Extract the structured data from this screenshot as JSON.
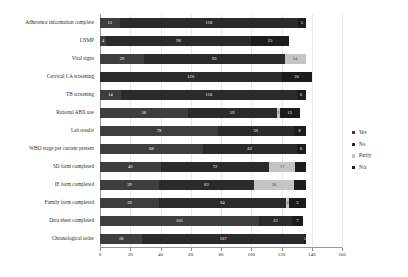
{
  "chart_data": {
    "type": "bar",
    "subtype": "stacked-horizontal",
    "title": "",
    "xlabel": "",
    "ylabel": "",
    "xlim": [
      0,
      160
    ],
    "ylim": null,
    "grid": true,
    "legend_position": "right",
    "xticks": [
      0,
      20,
      40,
      60,
      80,
      100,
      120,
      140,
      160
    ],
    "xtick_labels": [
      "0",
      "20",
      "40",
      "60",
      "80",
      "100",
      "120",
      "140",
      "160"
    ],
    "categories": [
      "Adherence information complete",
      "LNMP",
      "Vital signs",
      "Cervical CA screening",
      "TB screening",
      "Rational ABX use",
      "Lab results",
      "WHO stage per current present",
      "SD form completed",
      "IE form completed",
      "Family form completed",
      "Data sheet completed",
      "Chronological order"
    ],
    "series": [
      {
        "name": "Yes",
        "color": "#3e3e3e",
        "values": [
          13,
          4,
          29,
          0,
          14,
          58,
          78,
          68,
          40,
          39,
          39,
          105,
          28
        ]
      },
      {
        "name": "No",
        "color": "#2b2b2b",
        "values": [
          118,
          96,
          93,
          120,
          116,
          59,
          50,
          62,
          72,
          63,
          84,
          22,
          107
        ]
      },
      {
        "name": "Partly",
        "color": "#c4c4c4",
        "values": [
          0,
          0,
          14,
          0,
          0,
          2,
          0,
          0,
          17,
          26,
          2,
          0,
          0
        ]
      },
      {
        "name": "N/a",
        "color": "#1c1c1c",
        "values": [
          5,
          25,
          0,
          20,
          6,
          13,
          8,
          6,
          7,
          8,
          11,
          7,
          1
        ]
      }
    ],
    "bar_labels": [
      [
        "13",
        "118",
        "",
        "5"
      ],
      [
        "4",
        "96",
        "0",
        "25"
      ],
      [
        "29",
        "93",
        "14",
        ""
      ],
      [
        "0",
        "120",
        "0",
        "20"
      ],
      [
        "14",
        "116",
        "",
        "6"
      ],
      [
        "58",
        "59",
        "2",
        "13"
      ],
      [
        "78",
        "50",
        "",
        "8"
      ],
      [
        "68",
        "62",
        "",
        "6"
      ],
      [
        "40",
        "72",
        "17",
        ""
      ],
      [
        "39",
        "63",
        "26",
        ""
      ],
      [
        "39",
        "84",
        "2",
        "5"
      ],
      [
        "105",
        "22",
        "",
        "7"
      ],
      [
        "28",
        "107",
        "",
        "1"
      ]
    ]
  },
  "legend": {
    "items": [
      {
        "label": "Yes",
        "key": "yes"
      },
      {
        "label": "No",
        "key": "no"
      },
      {
        "label": "Partly",
        "key": "partly"
      },
      {
        "label": "N/a",
        "key": "na"
      }
    ]
  }
}
